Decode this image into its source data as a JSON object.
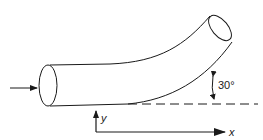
{
  "diagram": {
    "type": "bent pipe with coordinate axes",
    "angle_label": "30°",
    "x_axis_label": "x",
    "y_axis_label": "y",
    "colors": {
      "stroke": "#1a1a1a",
      "background": "#ffffff"
    }
  }
}
